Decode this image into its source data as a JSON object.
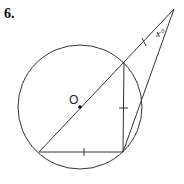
{
  "problem": {
    "number": "6."
  },
  "diagram": {
    "center_label": "O",
    "angle_label": "x°",
    "colors": {
      "stroke": "#333333",
      "background": "#ffffff"
    },
    "circle": {
      "cx": 80,
      "cy": 107,
      "r": 62
    },
    "points": {
      "apex": [
        174,
        9
      ],
      "upper_chord": [
        124,
        62
      ],
      "bottom_left": [
        39,
        152
      ],
      "bottom_right": [
        123,
        152
      ],
      "secant_exit": [
        141,
        104
      ],
      "center": [
        80,
        107
      ]
    }
  }
}
